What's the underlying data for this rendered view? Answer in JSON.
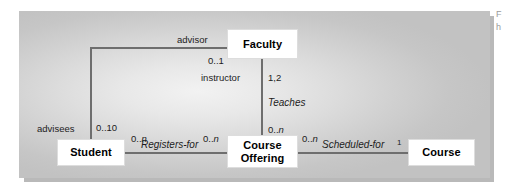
{
  "diagram": {
    "type": "uml-class-diagram",
    "entities": [
      {
        "id": "faculty",
        "label": "Faculty"
      },
      {
        "id": "student",
        "label": "Student"
      },
      {
        "id": "course-offering",
        "label_line1": "Course",
        "label_line2": "Offering"
      },
      {
        "id": "course",
        "label": "Course"
      }
    ],
    "associations": [
      {
        "id": "advisor-advisees",
        "name": "",
        "from": "student",
        "to": "faculty",
        "role_from": "advisees",
        "role_to": "advisor",
        "mult_from": "0..10",
        "mult_to": "0..1"
      },
      {
        "id": "teaches",
        "name": "Teaches",
        "from": "faculty",
        "to": "course-offering",
        "role_from": "instructor",
        "mult_from": "1,2",
        "mult_to": "0..n"
      },
      {
        "id": "registers-for",
        "name": "Registers-for",
        "from": "student",
        "to": "course-offering",
        "mult_from": "0..n",
        "mult_to": "0..n"
      },
      {
        "id": "scheduled-for",
        "name": "Scheduled-for",
        "from": "course-offering",
        "to": "course",
        "mult_from": "0..n",
        "mult_to": "1"
      }
    ],
    "labels": {
      "advisor": "advisor",
      "advisees": "advisees",
      "instructor": "instructor",
      "teaches": "Teaches",
      "registers_for": "Registers-for",
      "scheduled_for": "Scheduled-for",
      "mult_faculty_advisor": "0..1",
      "mult_student_advisees": "0..10",
      "mult_faculty_instructor": "1,2",
      "mult_offering_teaches": "0..n",
      "mult_student_registers": "0..n",
      "mult_offering_registers": "0..n",
      "mult_offering_scheduled": "0..n",
      "mult_course_scheduled": "1",
      "mult_n_prefix": "0..",
      "mult_n_suffix": "n"
    },
    "caption_fragment_line1": "F",
    "caption_fragment_line2": "h"
  },
  "colors": {
    "panel_center": "#f2f2f2",
    "panel_edge": "#c2c2c2",
    "line": "#6e6e6e",
    "box_fill": "#ffffff",
    "text": "#1c1c1c",
    "shadow": "#b9b9b9",
    "page_background": "#ffffff"
  }
}
